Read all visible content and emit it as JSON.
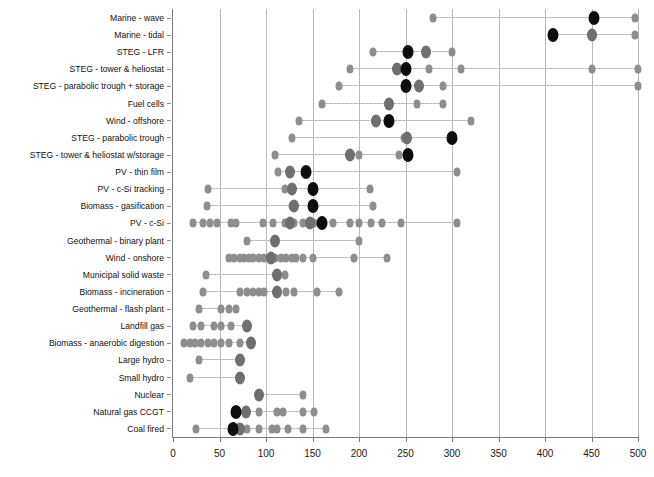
{
  "chart_data": {
    "type": "scatter",
    "title": "",
    "xlabel": "",
    "ylabel": "",
    "xlim": [
      0,
      500
    ],
    "xticks": [
      0,
      50,
      100,
      150,
      200,
      250,
      300,
      350,
      400,
      450,
      500
    ],
    "grid": "vertical",
    "legend": "none",
    "orientation": "horizontal-dotplot",
    "marker_roles": {
      "minor": "individual study estimate (light grey diamond)",
      "mid": "secondary / overlapping estimate (mid grey)",
      "major": "central or median estimate (black)"
    },
    "categories": [
      "Marine - wave",
      "Marine - tidal",
      "STEG - LFR",
      "STEG - tower & heliostat",
      "STEG - parabolic trough + storage",
      "Fuel cells",
      "Wind - offshore",
      "STEG - parabolic trough",
      "STEG - tower & heliostat w/storage",
      "PV - thin film",
      "PV - c-Si tracking",
      "Biomass - gasification",
      "PV - c-Si",
      "Geothermal - binary plant",
      "Wind - onshore",
      "Municipal solid waste",
      "Biomass - incineration",
      "Geothermal - flash plant",
      "Landfill gas",
      "Biomass - anaerobic digestion",
      "Large hydro",
      "Small hydro",
      "Nuclear",
      "Natural gas CCGT",
      "Coal fired"
    ],
    "series": [
      {
        "category": "Marine - wave",
        "minor": [
          280,
          497
        ],
        "mid": [],
        "major": [
          453
        ]
      },
      {
        "category": "Marine - tidal",
        "minor": [
          497
        ],
        "mid": [
          450
        ],
        "major": [
          409
        ]
      },
      {
        "category": "STEG - LFR",
        "minor": [
          215,
          300
        ],
        "mid": [
          272
        ],
        "major": [
          253
        ]
      },
      {
        "category": "STEG - tower & heliostat",
        "minor": [
          190,
          275,
          310,
          450,
          500
        ],
        "mid": [
          241
        ],
        "major": [
          250
        ]
      },
      {
        "category": "STEG - parabolic trough + storage",
        "minor": [
          178,
          290,
          500
        ],
        "mid": [
          264
        ],
        "major": [
          250
        ]
      },
      {
        "category": "Fuel cells",
        "minor": [
          160,
          262,
          290
        ],
        "mid": [
          232
        ],
        "major": []
      },
      {
        "category": "Wind - offshore",
        "minor": [
          135,
          320
        ],
        "mid": [
          218
        ],
        "major": [
          232
        ]
      },
      {
        "category": "STEG - parabolic trough",
        "minor": [
          128,
          248
        ],
        "mid": [
          252
        ],
        "major": [
          300
        ]
      },
      {
        "category": "STEG - tower & heliostat w/storage",
        "minor": [
          110,
          200,
          243
        ],
        "mid": [
          190
        ],
        "major": [
          253
        ]
      },
      {
        "category": "PV - thin film",
        "minor": [
          113,
          305
        ],
        "mid": [
          126
        ],
        "major": [
          143
        ]
      },
      {
        "category": "PV - c-Si tracking",
        "minor": [
          38,
          120,
          212
        ],
        "mid": [
          128
        ],
        "major": [
          150
        ]
      },
      {
        "category": "Biomass - gasification",
        "minor": [
          37,
          128,
          215
        ],
        "mid": [
          130
        ],
        "major": [
          150
        ]
      },
      {
        "category": "PV - c-Si",
        "minor": [
          22,
          32,
          40,
          47,
          62,
          68,
          97,
          108,
          120,
          130,
          140,
          152,
          172,
          190,
          200,
          213,
          225,
          245,
          305
        ],
        "mid": [
          126,
          147
        ],
        "major": [
          160
        ]
      },
      {
        "category": "Geothermal - binary plant",
        "minor": [
          80,
          200
        ],
        "mid": [
          110
        ],
        "major": []
      },
      {
        "category": "Wind - onshore",
        "minor": [
          60,
          66,
          72,
          76,
          82,
          86,
          92,
          98,
          104,
          110,
          116,
          122,
          128,
          132,
          140,
          150,
          195,
          230
        ],
        "mid": [
          105
        ],
        "major": []
      },
      {
        "category": "Municipal solid waste",
        "minor": [
          35,
          120
        ],
        "mid": [
          112
        ],
        "major": []
      },
      {
        "category": "Biomass - incineration",
        "minor": [
          32,
          72,
          80,
          86,
          92,
          98,
          122,
          130,
          155,
          178
        ],
        "mid": [
          112
        ],
        "major": []
      },
      {
        "category": "Geothermal - flash plant",
        "minor": [
          28,
          52,
          60,
          68
        ],
        "mid": [],
        "major": []
      },
      {
        "category": "Landfill gas",
        "minor": [
          22,
          30,
          44,
          52,
          62
        ],
        "mid": [
          80
        ],
        "major": []
      },
      {
        "category": "Biomass - anaerobic digestion",
        "minor": [
          12,
          18,
          24,
          30,
          38,
          44,
          52,
          60,
          72
        ],
        "mid": [
          84
        ],
        "major": []
      },
      {
        "category": "Large hydro",
        "minor": [
          28
        ],
        "mid": [
          72
        ],
        "major": []
      },
      {
        "category": "Small hydro",
        "minor": [
          18
        ],
        "mid": [
          72
        ],
        "major": []
      },
      {
        "category": "Nuclear",
        "minor": [
          140
        ],
        "mid": [
          93
        ],
        "major": []
      },
      {
        "category": "Natural gas CCGT",
        "minor": [
          92,
          112,
          118,
          140,
          152
        ],
        "mid": [
          78
        ],
        "major": [
          68
        ]
      },
      {
        "category": "Coal fired",
        "minor": [
          25,
          80,
          92,
          106,
          112,
          124,
          140,
          164
        ],
        "mid": [
          72
        ],
        "major": [
          65
        ]
      }
    ]
  }
}
